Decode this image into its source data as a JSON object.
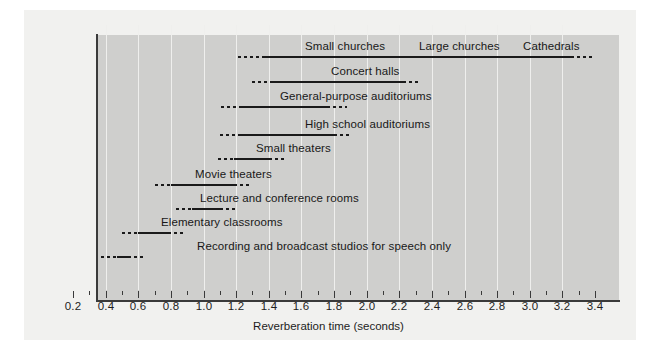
{
  "chart_data": {
    "type": "bar",
    "title": "",
    "xlabel": "Reverberation time (seconds)",
    "ylabel": "",
    "xlim": [
      0.2,
      3.4
    ],
    "grid": true,
    "legend_position": "none",
    "orientation": "horizontal",
    "tick_labels": [
      "0.2",
      "0.4",
      "0.6",
      "0.8",
      "1.0",
      "1.2",
      "1.4",
      "1.6",
      "1.8",
      "2.0",
      "2.2",
      "2.4",
      "2.6",
      "2.8",
      "3.0",
      "3.2",
      "3.4"
    ],
    "tick_values": [
      0.2,
      0.4,
      0.6,
      0.8,
      1.0,
      1.2,
      1.4,
      1.6,
      1.8,
      2.0,
      2.2,
      2.4,
      2.6,
      2.8,
      3.0,
      3.2,
      3.4
    ],
    "categories": [
      "Small churches",
      "Large churches",
      "Cathedrals",
      "Concert halls",
      "General-purpose auditoriums",
      "High school auditoriums",
      "Small theaters",
      "Movie theaters",
      "Lecture and conference rooms",
      "Elementary classrooms",
      "Recording and broadcast studios for speech only"
    ],
    "series": [
      {
        "name": "Small churches / Large churches / Cathedrals",
        "labels": [
          "Small churches",
          "Large churches",
          "Cathedrals"
        ],
        "label_values": [
          1.62,
          2.32,
          2.96
        ],
        "dot_start": 1.21,
        "solid_start": 1.36,
        "solid_end": 3.25,
        "dot_end": 3.4,
        "row_top": 40
      },
      {
        "name": "Concert halls",
        "labels": [
          "Concert halls"
        ],
        "label_values": [
          1.78
        ],
        "dot_start": 1.3,
        "solid_start": 1.41,
        "solid_end": 2.22,
        "dot_end": 2.33,
        "row_top": 65
      },
      {
        "name": "General-purpose auditoriums",
        "labels": [
          "General-purpose auditoriums"
        ],
        "label_values": [
          1.47
        ],
        "dot_start": 1.11,
        "solid_start": 1.22,
        "solid_end": 1.76,
        "dot_end": 1.88,
        "row_top": 90
      },
      {
        "name": "High school auditoriums",
        "labels": [
          "High school auditoriums"
        ],
        "label_values": [
          1.62
        ],
        "dot_start": 1.1,
        "solid_start": 1.21,
        "solid_end": 1.8,
        "dot_end": 1.9,
        "row_top": 118
      },
      {
        "name": "Small theaters",
        "labels": [
          "Small theaters"
        ],
        "label_values": [
          1.32
        ],
        "dot_start": 1.09,
        "solid_start": 1.19,
        "solid_end": 1.4,
        "dot_end": 1.5,
        "row_top": 142
      },
      {
        "name": "Movie theaters",
        "labels": [
          "Movie theaters"
        ],
        "label_values": [
          0.95
        ],
        "dot_start": 0.7,
        "solid_start": 0.8,
        "solid_end": 1.19,
        "dot_end": 1.3,
        "row_top": 168
      },
      {
        "name": "Lecture and conference rooms",
        "labels": [
          "Lecture and conference rooms"
        ],
        "label_values": [
          0.98
        ],
        "dot_start": 0.83,
        "solid_start": 0.93,
        "solid_end": 1.1,
        "dot_end": 1.21,
        "row_top": 192
      },
      {
        "name": "Elementary classrooms",
        "labels": [
          "Elementary classrooms"
        ],
        "label_values": [
          0.74
        ],
        "dot_start": 0.5,
        "solid_start": 0.6,
        "solid_end": 0.78,
        "dot_end": 0.89,
        "row_top": 216
      },
      {
        "name": "Recording and broadcast studios for speech only",
        "labels": [
          "Recording and broadcast studios for speech only"
        ],
        "label_values": [
          0.96
        ],
        "dot_start": 0.37,
        "solid_start": 0.47,
        "solid_end": 0.54,
        "dot_end": 0.63,
        "row_top": 240
      }
    ],
    "colors": {
      "plot_background": "#cfcfcd",
      "panel_background": "#f1f1ef",
      "gridline": "#efefed",
      "axis": "#3a3a3a",
      "bar": "#1a1a1a",
      "text": "#1d1d1d"
    }
  }
}
